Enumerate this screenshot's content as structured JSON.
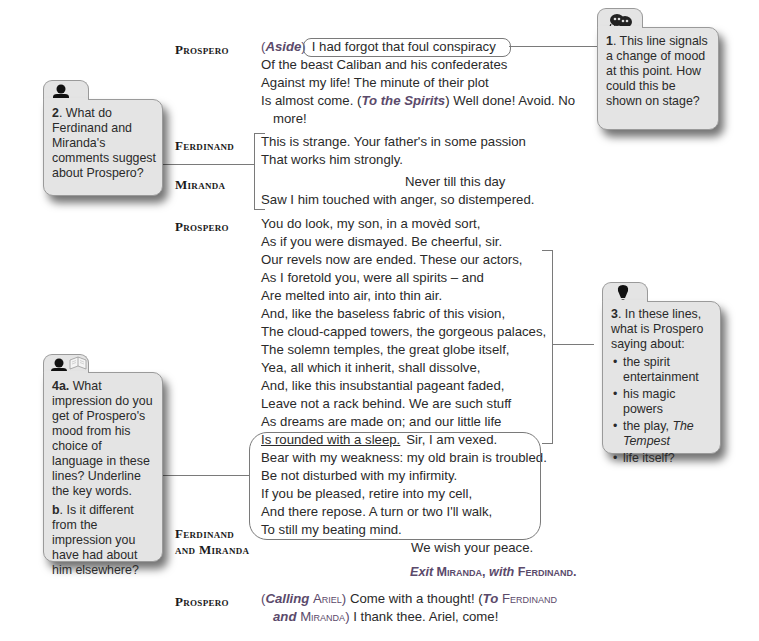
{
  "script": {
    "speeches": [
      {
        "speaker": "Prospero",
        "lines": [
          {
            "direction": "Aside",
            "text": "I had forgot that foul conspiracy"
          },
          {
            "text": "Of the beast Caliban and his confederates"
          },
          {
            "text": "Against my life! The minute of their plot"
          },
          {
            "text_before": "Is almost come. (",
            "direction": "To the Spirits",
            "text_after": ") Well done! Avoid. No"
          },
          {
            "text": "more!"
          }
        ]
      },
      {
        "speaker": "Ferdinand",
        "lines": [
          {
            "text": "This is strange. Your father's in some passion"
          },
          {
            "text": "That works him strongly."
          }
        ]
      },
      {
        "speaker": "Miranda",
        "lines": [
          {
            "text": "Never till this day"
          },
          {
            "text": "Saw I him touched with anger, so distempered."
          }
        ]
      },
      {
        "speaker": "Prospero",
        "lines": [
          {
            "text": "You do look, my son, in a movèd sort,"
          },
          {
            "text": "As if you were dismayed. Be cheerful, sir."
          },
          {
            "text": "Our revels now are ended. These our actors,"
          },
          {
            "text": "As I foretold you, were all spirits – and"
          },
          {
            "text": "Are melted into air, into thin air."
          },
          {
            "text": "And, like the baseless fabric of this vision,"
          },
          {
            "text": "The cloud-capped towers, the gorgeous palaces,"
          },
          {
            "text": "The solemn temples, the great globe itself,"
          },
          {
            "text": "Yea, all which it inherit, shall dissolve,"
          },
          {
            "text": "And, like this insubstantial pageant faded,"
          },
          {
            "text": "Leave not a rack behind. We are such stuff"
          },
          {
            "text": "As dreams are made on; and our little life"
          },
          {
            "text_underlined": "Is rounded with a sleep.",
            "text_after": "Sir, I am vexed."
          },
          {
            "text": "Bear with my weakness: my old brain is troubled."
          },
          {
            "text": "Be not disturbed with my infirmity."
          },
          {
            "text": "If you be pleased, retire into my cell,"
          },
          {
            "text": "And there repose. A turn or two I'll walk,"
          },
          {
            "text": "To still my beating mind."
          }
        ]
      },
      {
        "speaker_line1": "Ferdinand",
        "speaker_line2": "and Miranda",
        "lines": [
          {
            "text": "We wish your peace."
          }
        ]
      },
      {
        "stage_direction": {
          "exit": "Exit",
          "name1": "Miranda,",
          "with": "with",
          "name2": "Ferdinand."
        }
      },
      {
        "speaker": "Prospero",
        "lines": [
          {
            "dir_open": "(",
            "direction": "Calling",
            "dir_name": "Ariel",
            "dir_close": ")",
            "text": " Come with a thought! (",
            "direction2": "To",
            "dir_name2": "Ferdinand"
          },
          {
            "direction": "and",
            "dir_name": "Miranda",
            "dir_close": ")",
            "text": " I thank thee. Ariel, come!"
          }
        ]
      }
    ]
  },
  "annotations": {
    "q1": {
      "icon": "theatre-masks-icon",
      "number": "1",
      "text": ". This line signals a change of mood at this point. How could this be shown on stage?"
    },
    "q2": {
      "icon": "person-icon",
      "number": "2",
      "text": ". What do Ferdinand and Miranda's comments suggest about Prospero?"
    },
    "q3": {
      "icon": "lightbulb-icon",
      "number": "3",
      "text": ". In these lines, what is Prospero saying about:",
      "bullets": [
        {
          "text": "the spirit entertainment"
        },
        {
          "text": "his magic powers"
        },
        {
          "text": "the play, ",
          "italic": "The Tempest"
        },
        {
          "text": "life itself?"
        }
      ]
    },
    "q4": {
      "icons": [
        "person-icon",
        "book-icon"
      ],
      "a_number": "4a.",
      "a_text": " What impression do you get of Prospero's mood from his choice of language in these lines? Underline the key words.",
      "b_number": "b",
      "b_text": ".  Is it different from the impression you have had about him elsewhere?"
    }
  }
}
